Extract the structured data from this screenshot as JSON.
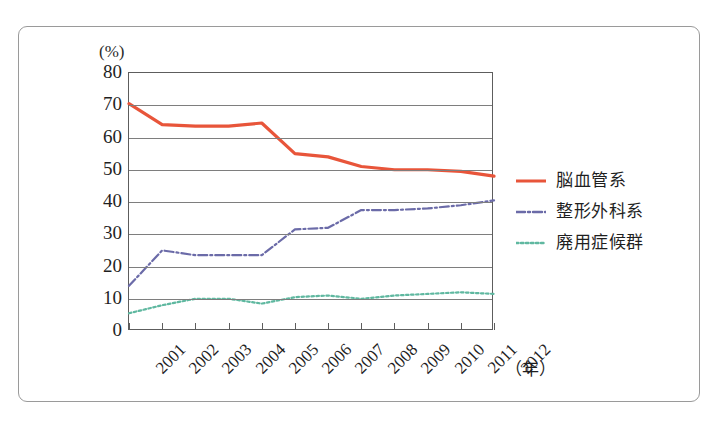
{
  "chart_data": {
    "type": "line",
    "title": "",
    "xlabel": "（年）",
    "ylabel": "(%)",
    "ylim": [
      0,
      80
    ],
    "ytick_step": 10,
    "grid": true,
    "legend_position": "right",
    "categories": [
      "2001",
      "2002",
      "2003",
      "2004",
      "2005",
      "2006",
      "2007",
      "2008",
      "2009",
      "2010",
      "2011",
      "2012"
    ],
    "yticks": [
      "80",
      "70",
      "60",
      "50",
      "40",
      "30",
      "20",
      "10",
      "0"
    ],
    "series": [
      {
        "name": "脳血管系",
        "color": "#E8553A",
        "style": "solid",
        "values": [
          70.5,
          64.0,
          63.5,
          63.5,
          64.5,
          55.0,
          54.0,
          51.0,
          50.0,
          50.0,
          49.5,
          48.0
        ]
      },
      {
        "name": "整形外科系",
        "color": "#6B6BA8",
        "style": "dashdot",
        "values": [
          14.0,
          25.0,
          23.5,
          23.5,
          23.5,
          31.5,
          32.0,
          37.5,
          37.5,
          38.0,
          39.0,
          40.5
        ]
      },
      {
        "name": "廃用症候群",
        "color": "#5FB8A0",
        "style": "dotted",
        "values": [
          5.5,
          8.0,
          10.0,
          10.0,
          8.5,
          10.5,
          11.0,
          10.0,
          11.0,
          11.5,
          12.0,
          11.5
        ]
      }
    ]
  },
  "figure": {
    "unit_label": "(%)",
    "xaxis_unit": "（年）"
  }
}
